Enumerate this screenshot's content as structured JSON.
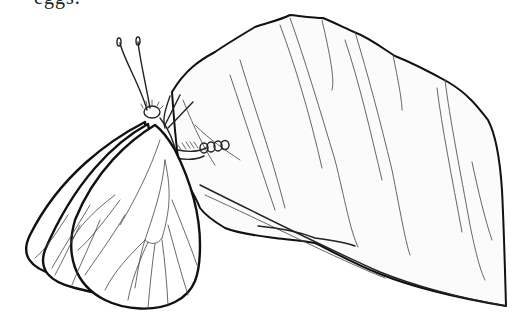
{
  "caption": {
    "text": "eggs."
  },
  "illustration": {
    "subject": "butterfly perched on a leaf laying eggs",
    "style": "black and white line drawing",
    "elements": [
      "butterfly",
      "antennae",
      "wings",
      "leaf",
      "leaf-veins",
      "eggs"
    ]
  },
  "colors": {
    "line": "#111111",
    "background": "#ffffff",
    "leaf_fill": "#fbfbfb"
  }
}
